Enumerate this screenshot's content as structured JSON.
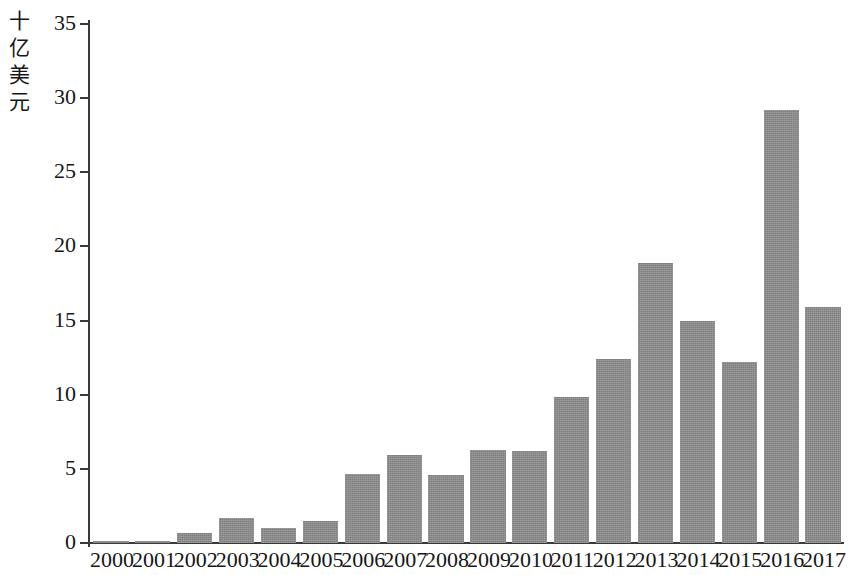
{
  "chart_data": {
    "type": "bar",
    "title": "",
    "subtitle": "",
    "xlabel": "",
    "ylabel": "十亿美元",
    "ylabel_chars": [
      "十",
      "亿",
      "美",
      "元"
    ],
    "categories": [
      "2000",
      "2001",
      "2002",
      "2003",
      "2004",
      "2005",
      "2006",
      "2007",
      "2008",
      "2009",
      "2010",
      "2011",
      "2012",
      "2013",
      "2014",
      "2015",
      "2016",
      "2017"
    ],
    "values": [
      0.15,
      0.15,
      0.7,
      1.7,
      1.0,
      1.5,
      4.65,
      5.95,
      4.6,
      6.3,
      6.2,
      9.85,
      12.4,
      18.9,
      15.0,
      12.2,
      29.2,
      15.9
    ],
    "yticks": [
      0,
      5,
      10,
      15,
      20,
      25,
      30,
      35
    ],
    "ytick_labels": [
      "0",
      "5",
      "10",
      "15",
      "20",
      "25",
      "30",
      "35"
    ],
    "ylim": [
      0,
      35
    ],
    "grid": false,
    "legend": null,
    "legend_position": "none",
    "bar_color": "#8b8b8b",
    "axis_color": "#3a3a3a",
    "background_color": "#ffffff"
  }
}
